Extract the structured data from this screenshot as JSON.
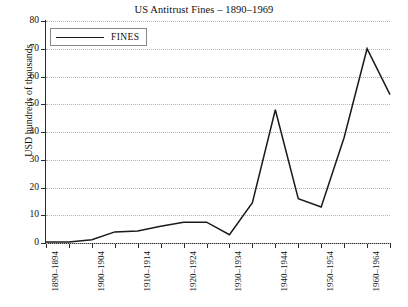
{
  "chart_data": {
    "type": "line",
    "title": "US Antitrust Fines – 1890–1969",
    "xlabel": "",
    "ylabel": "USD hundreds of thousands",
    "ylim": [
      0,
      80
    ],
    "yticks": [
      0,
      10,
      20,
      30,
      40,
      50,
      60,
      70,
      80
    ],
    "grid": true,
    "legend_position": "top-left",
    "categories": [
      "1890–1894",
      "1895–1899",
      "1900–1904",
      "1905–1909",
      "1910–1914",
      "1915–1919",
      "1920–1924",
      "1925–1929",
      "1930–1934",
      "1935–1939",
      "1940–1944",
      "1945–1949",
      "1950–1954",
      "1955–1959",
      "1960–1964",
      "1965–1969"
    ],
    "tick_labels": [
      "1890–1894",
      "",
      "1900–1904",
      "",
      "1910–1914",
      "",
      "1920–1924",
      "",
      "1930–1934",
      "",
      "1940–1944",
      "",
      "1950–1954",
      "",
      "1960–1964",
      ""
    ],
    "series": [
      {
        "name": "FINES",
        "color": "#1a1a1a",
        "values": [
          0.4,
          0.4,
          1.2,
          4.0,
          4.3,
          6.0,
          7.5,
          7.5,
          3.0,
          14.5,
          48.0,
          16.0,
          13.0,
          38.0,
          70.0,
          53.5
        ]
      }
    ]
  },
  "legend": {
    "entries": [
      {
        "label": "FINES"
      }
    ]
  }
}
